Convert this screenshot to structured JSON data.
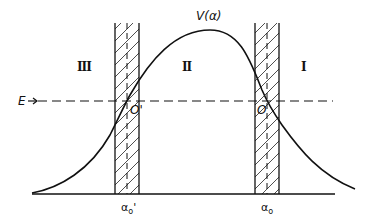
{
  "figure": {
    "curve_label": "V(α)",
    "energy_label": "E",
    "regions": {
      "left": "III",
      "middle": "II",
      "right": "I"
    },
    "turning_points": {
      "left": "O'",
      "right": "O"
    },
    "axis_ticks": {
      "left": "α",
      "left_sub": "o",
      "left_prime": "'",
      "right": "α",
      "right_sub": "o"
    },
    "colors": {
      "ink": "#111111",
      "background": "#ffffff"
    }
  }
}
